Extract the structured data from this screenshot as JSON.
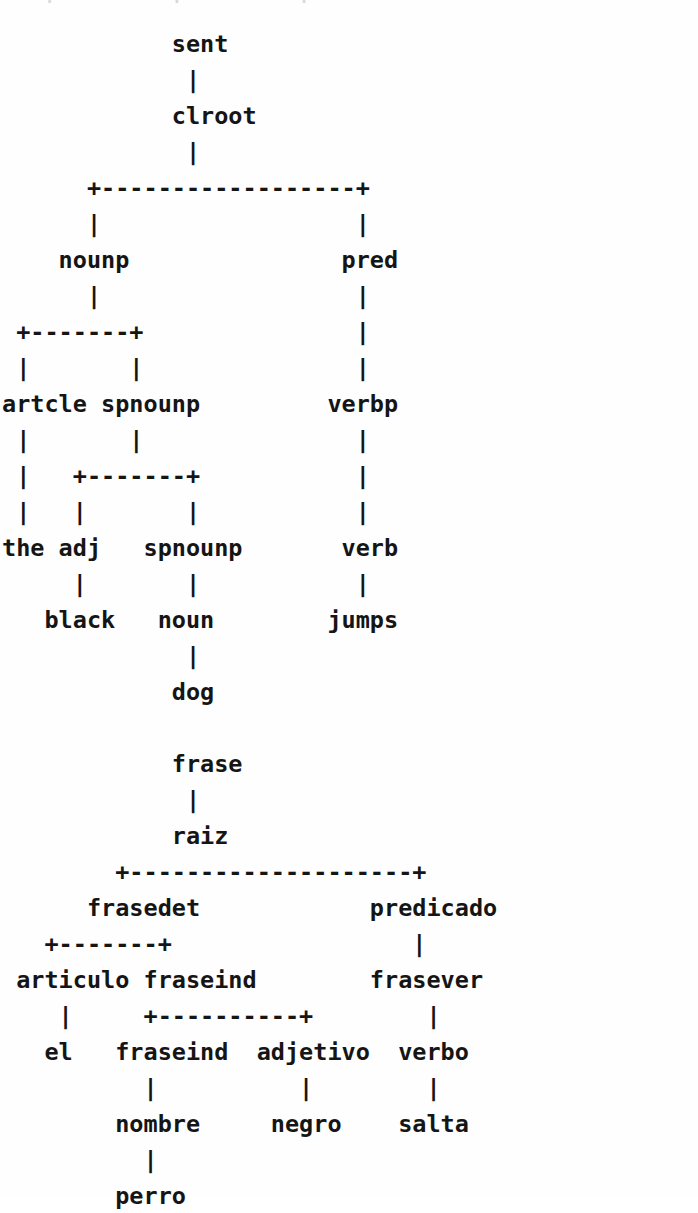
{
  "document": {
    "kind": "ascii-parse-trees",
    "background_color": "#fefefe",
    "text_color": "#151515",
    "char_cell_width_px": 19,
    "line_height_px": 36,
    "top_clipped_remnant": "   |        |        |"
  },
  "trees": [
    {
      "id": "english-parse-tree",
      "name": "English sentence parse tree",
      "sentence": "the black dog jumps",
      "root": "sent",
      "nodes": [
        "sent",
        "clroot",
        "nounp",
        "pred",
        "artcle",
        "spnounp",
        "the",
        "adj",
        "spnounp",
        "verbp",
        "black",
        "noun",
        "verb",
        "dog",
        "jumps"
      ],
      "terminals": [
        "the",
        "black",
        "dog",
        "jumps"
      ],
      "ascii": "            sent\n             |\n            clroot\n             |\n      +------------------+\n      |                  |\n    nounp               pred\n      |                  |\n +-------+               |\n |       |               |\nartcle spnounp         verbp\n |       |               |\n |   +-------+           |\n |   |       |           |\nthe adj   spnounp       verb\n     |       |           |\n   black   noun        jumps\n             |\n            dog"
    },
    {
      "id": "spanish-parse-tree",
      "name": "Spanish sentence parse tree",
      "sentence": "el perro negro salta",
      "root": "frase",
      "nodes": [
        "frase",
        "raiz",
        "frasedet",
        "predicado",
        "articulo",
        "fraseind",
        "frasever",
        "el",
        "fraseind",
        "adjetivo",
        "verbo",
        "nombre",
        "negro",
        "salta",
        "perro"
      ],
      "terminals": [
        "el",
        "perro",
        "negro",
        "salta"
      ],
      "ascii": "            frase\n             |\n            raiz\n        +--------------------+\n      frasedet            predicado\n   +-------+                 |\n articulo fraseind        frasever\n    |     +----------+        |\n   el   fraseind  adjetivo  verbo\n          |          |        |\n        nombre     negro    salta\n          |\n        perro"
    }
  ]
}
